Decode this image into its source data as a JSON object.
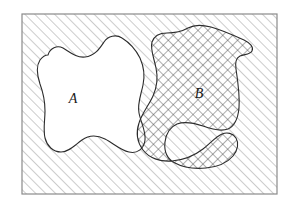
{
  "figure": {
    "frame": {
      "x": 22,
      "y": 14,
      "width": 255,
      "height": 180,
      "stroke_color": "#8a8a8a",
      "stroke_width": 1.2,
      "fill_color": "#ffffff"
    },
    "background_hatch": {
      "name": "diagonal-hatch",
      "angle_degrees": -45,
      "spacing_px": 7,
      "line_color": "#9a9a9a",
      "line_width": 1.0
    },
    "crosshatch": {
      "name": "cross-hatch",
      "angle_degrees": 45,
      "spacing_px": 7,
      "line_color": "#4a4a4a",
      "line_width": 0.9
    },
    "outline_color": "#2b2b2b",
    "outline_width": 1.1,
    "regions": [
      {
        "id": "A",
        "label": "A",
        "label_x": 73,
        "label_y": 103,
        "fill": "white",
        "shading": "none",
        "path": "M 48 55 C 50 48, 57 45, 63 48 C 70 52, 76 58, 85 57 C 95 56, 100 48, 104 42 C 108 36, 116 34, 122 38 C 130 43, 136 50, 140 58 C 144 67, 145 76, 143 85 C 141 95, 137 104, 139 113 C 141 123, 146 131, 145 140 C 144 149, 137 154, 129 152 C 120 150, 113 143, 105 139 C 97 135, 89 135, 82 140 C 75 145, 69 152, 61 152 C 53 152, 47 146, 45 138 C 43 129, 45 120, 45 111 C 45 101, 43 92, 40 84 C 37 75, 36 66, 40 60 C 43 56, 45 55, 48 55 Z"
      },
      {
        "id": "B",
        "label": "B",
        "label_x": 199,
        "label_y": 98,
        "fill": "crosshatch",
        "shading": "cross-hatch",
        "path": "M 188 28 C 195 24, 203 25, 211 27 C 222 30, 233 35, 244 40 C 250 43, 254 47, 252 51 C 250 55, 244 54, 240 56 C 236 58, 235 63, 236 69 C 238 82, 240 95, 239 108 C 238 118, 235 126, 228 129 C 220 132, 211 129, 203 126 C 194 123, 185 121, 177 124 C 170 127, 166 134, 165 142 C 164 151, 167 159, 175 163 C 184 168, 195 169, 206 168 C 217 167, 227 163, 233 156 C 238 150, 239 143, 236 138 C 233 133, 227 132, 222 134 C 215 137, 210 144, 203 149 C 194 156, 183 160, 172 161 C 160 162, 149 158, 143 150 C 137 142, 136 132, 139 123 C 142 113, 149 105, 153 96 C 157 87, 158 77, 156 68 C 154 58, 150 49, 152 42 C 154 36, 160 33, 167 33 C 174 33, 181 32, 188 28 Z"
      }
    ],
    "labels": [
      {
        "name": "region-a-label",
        "text": "A"
      },
      {
        "name": "region-b-label",
        "text": "B"
      }
    ]
  }
}
